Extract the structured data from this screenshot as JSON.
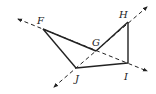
{
  "figure": {
    "type": "geometry-diagram",
    "points": {
      "F": {
        "label": "F",
        "x": 43,
        "y": 29,
        "lx": 37,
        "ly": 24
      },
      "G": {
        "label": "G",
        "x": 96,
        "y": 51,
        "lx": 92,
        "ly": 46
      },
      "H": {
        "label": "H",
        "x": 128,
        "y": 22,
        "lx": 119,
        "ly": 18
      },
      "I": {
        "label": "I",
        "x": 128,
        "y": 63,
        "lx": 124,
        "ly": 80
      },
      "J": {
        "label": "J",
        "x": 76,
        "y": 68,
        "lx": 75,
        "ly": 82
      }
    },
    "solid_segments": [
      [
        "F",
        "J"
      ],
      [
        "F",
        "G"
      ],
      [
        "J",
        "I"
      ],
      [
        "I",
        "H"
      ],
      [
        "G",
        "H"
      ]
    ],
    "dashed_lines": [
      {
        "name": "line-FI",
        "through": [
          "F",
          "I"
        ],
        "start": [
          18,
          19
        ],
        "end": [
          147,
          71
        ]
      },
      {
        "name": "line-JH",
        "through": [
          "J",
          "H"
        ],
        "start": [
          54,
          87
        ],
        "end": [
          147,
          7
        ]
      }
    ],
    "stroke_color": "#222222"
  }
}
